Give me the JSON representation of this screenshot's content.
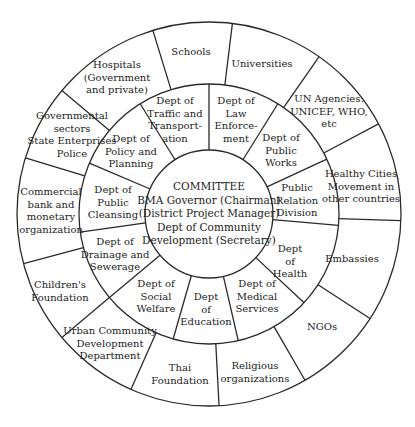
{
  "diagram": {
    "geometry": {
      "cx": 209,
      "cy": 214,
      "r_inner": 64,
      "r_middle": 130,
      "r_outer": 192
    },
    "colors": {
      "line": "#2a2a2a",
      "text": "#222222",
      "background": "#ffffff"
    },
    "center": {
      "label": "COMMITTEE\nBMA Governor (Chairman)\n(District Project Manager)\nDept of Community\nDevelopment (Secretary)",
      "x": 209,
      "y": 214
    },
    "middle_ring": {
      "spoke_angles": [
        -90,
        -58,
        -25,
        5,
        43,
        77,
        106,
        140,
        172,
        203,
        238
      ],
      "items": [
        {
          "label": "Dept of\nTraffic and\nTransport-\nation",
          "x": 175,
          "y": 120
        },
        {
          "label": "Dept of\nLaw\nEnforce-\nment",
          "x": 236,
          "y": 120
        },
        {
          "label": "Dept of\nPublic\nWorks",
          "x": 281,
          "y": 151
        },
        {
          "label": "Public\nRelation\nDivision",
          "x": 297,
          "y": 201
        },
        {
          "label": "Dept\nof\nHealth",
          "x": 290,
          "y": 262
        },
        {
          "label": "Dept of\nMedical\nServices",
          "x": 257,
          "y": 297
        },
        {
          "label": "Dept\nof\nEducation",
          "x": 206,
          "y": 310
        },
        {
          "label": "Dept of\nSocial\nWelfare",
          "x": 156,
          "y": 297
        },
        {
          "label": "Dept of\nDrainage and\nSewerage",
          "x": 115,
          "y": 255
        },
        {
          "label": "Dept of\nPublic\nCleansing",
          "x": 113,
          "y": 203
        },
        {
          "label": "Dept of\nPolicy and\nPlanning",
          "x": 131,
          "y": 152
        }
      ]
    },
    "outer_ring": {
      "spoke_angles": [
        -107,
        -83,
        -55,
        -28,
        2,
        33,
        60,
        87,
        114,
        140,
        165,
        197,
        220
      ],
      "items": [
        {
          "label": "Schools",
          "x": 191,
          "y": 52
        },
        {
          "label": "Universities",
          "x": 262,
          "y": 64
        },
        {
          "label": "UN Agencies:\nUNICEF, WHO,\netc",
          "x": 329,
          "y": 112
        },
        {
          "label": "Healthy Cities\nMovement in\nother countries",
          "x": 361,
          "y": 187
        },
        {
          "label": "Embassies",
          "x": 352,
          "y": 259
        },
        {
          "label": "NGOs",
          "x": 322,
          "y": 327
        },
        {
          "label": "Religious\norganizations",
          "x": 255,
          "y": 372
        },
        {
          "label": "Thai\nFoundation",
          "x": 180,
          "y": 374
        },
        {
          "label": "Urban Community\nDevelopment\nDepartment",
          "x": 110,
          "y": 344
        },
        {
          "label": "Children's\nFoundation",
          "x": 60,
          "y": 291
        },
        {
          "label": "Commercial\nbank and\nmonetary\norganization",
          "x": 51,
          "y": 211
        },
        {
          "label": "Governmental\nsectors\nState Enterprises\nPolice",
          "x": 72,
          "y": 135
        },
        {
          "label": "Hospitals\n(Government\nand private)",
          "x": 117,
          "y": 78
        }
      ]
    }
  }
}
